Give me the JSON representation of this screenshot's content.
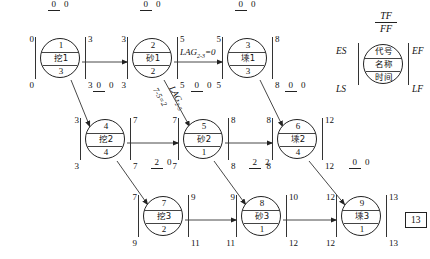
{
  "diagram": {
    "total_duration": "13",
    "nodes": [
      {
        "key": "n1",
        "id": "1",
        "name": "挖1",
        "duration": "3",
        "es": "0",
        "ef": "3",
        "ls": "0",
        "lf": "3",
        "tf": "0",
        "ff": "0",
        "x": 60,
        "y": 62
      },
      {
        "key": "n2",
        "id": "2",
        "name": "砂1",
        "duration": "2",
        "es": "3",
        "ef": "5",
        "ls": "3",
        "lf": "5",
        "tf": "0",
        "ff": "0",
        "x": 152,
        "y": 62
      },
      {
        "key": "n3",
        "id": "3",
        "name": "塖1",
        "duration": "3",
        "es": "5",
        "ef": "8",
        "ls": "5",
        "lf": "8",
        "tf": "0",
        "ff": "0",
        "x": 247,
        "y": 62
      },
      {
        "key": "n4",
        "id": "4",
        "name": "挖2",
        "duration": "4",
        "es": "3",
        "ef": "7",
        "ls": "3",
        "lf": "7",
        "tf": "0",
        "ff": "0",
        "x": 105,
        "y": 143
      },
      {
        "key": "n5",
        "id": "5",
        "name": "砂2",
        "duration": "1",
        "es": "7",
        "ef": "8",
        "ls": "7",
        "lf": "8",
        "tf": "0",
        "ff": "0",
        "x": 203,
        "y": 143
      },
      {
        "key": "n6",
        "id": "6",
        "name": "塖2",
        "duration": "4",
        "es": "8",
        "ef": "12",
        "ls": "8",
        "lf": "12",
        "tf": "0",
        "ff": "0",
        "x": 297,
        "y": 143
      },
      {
        "key": "n7",
        "id": "7",
        "name": "挖3",
        "duration": "2",
        "es": "7",
        "ef": "9",
        "ls": "9",
        "lf": "11",
        "tf": "2",
        "ff": "0",
        "x": 163,
        "y": 220
      },
      {
        "key": "n8",
        "id": "8",
        "name": "砂3",
        "duration": "1",
        "es": "9",
        "ef": "10",
        "ls": "11",
        "lf": "12",
        "tf": "2",
        "ff": "2",
        "x": 261,
        "y": 220
      },
      {
        "key": "n9",
        "id": "9",
        "name": "塖3",
        "duration": "1",
        "es": "12",
        "ef": "13",
        "ls": "12",
        "lf": "13",
        "tf": "0",
        "ff": "0",
        "x": 361,
        "y": 220
      }
    ],
    "legend": {
      "id_label": "代号",
      "name_label": "名称",
      "duration_label": "时间",
      "es": "ES",
      "ef": "EF",
      "ls": "LS",
      "lf": "LF",
      "tf": "TF",
      "ff": "FF"
    },
    "lag_labels": {
      "lag_2_3_text": "LAG",
      "lag_2_3_sub": "2-3",
      "lag_2_3_value": "=0",
      "lag_2_5_text": "LAG",
      "lag_2_5_sub": "2-5",
      "lag_2_5_calc": "7-5=2"
    },
    "end_marker": "13"
  }
}
